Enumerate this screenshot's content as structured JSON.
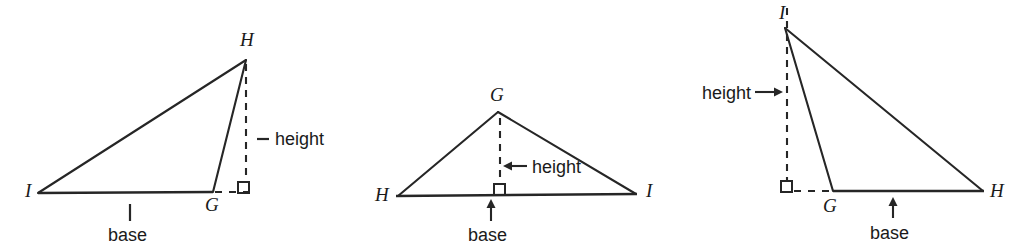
{
  "figure": {
    "kind": "geometry-diagram",
    "stroke_color": "#262626",
    "background_color": "#ffffff",
    "label_color": "#1a1a1a"
  },
  "diagrams": [
    {
      "id": "triangle-1",
      "vertices": [
        {
          "name": "H",
          "label": "H",
          "x": 246,
          "y": 60
        },
        {
          "name": "I",
          "label": "I",
          "x": 38,
          "y": 193
        },
        {
          "name": "G",
          "label": "G",
          "x": 213,
          "y": 192
        }
      ],
      "vertex_label_positions": [
        {
          "name": "H",
          "label": "H",
          "x": 240,
          "y": 46
        },
        {
          "name": "I",
          "label": "I",
          "x": 24,
          "y": 197
        },
        {
          "name": "G",
          "label": "G",
          "x": 206,
          "y": 210
        }
      ],
      "height": {
        "label": "height",
        "label_x": 272,
        "label_y": 145,
        "dashed_from": {
          "x": 246,
          "y": 64
        },
        "dashed_to": {
          "x": 246,
          "y": 188
        },
        "leader_from": {
          "x": 256,
          "y": 139
        },
        "leader_to": {
          "x": 268,
          "y": 139
        },
        "foot": {
          "x": 246,
          "y": 192
        }
      },
      "base": {
        "label": "base",
        "label_x": 110,
        "label_y": 240,
        "tick_x": 130,
        "tick_top": 204,
        "tick_bottom": 222
      },
      "right_angle": {
        "x": 238,
        "y": 182,
        "size": 11
      },
      "base_extension": {
        "from_x": 213,
        "to_x": 248,
        "y": 192
      }
    },
    {
      "id": "triangle-2",
      "vertices": [
        {
          "name": "G",
          "label": "G",
          "x": 498,
          "y": 112
        },
        {
          "name": "H",
          "label": "H",
          "x": 398,
          "y": 196
        },
        {
          "name": "I",
          "label": "I",
          "x": 636,
          "y": 194
        }
      ],
      "vertex_label_positions": [
        {
          "name": "G",
          "label": "G",
          "x": 491,
          "y": 100
        },
        {
          "name": "H",
          "label": "H",
          "x": 376,
          "y": 200
        },
        {
          "name": "I",
          "label": "I",
          "x": 646,
          "y": 196
        }
      ],
      "height": {
        "label": "height",
        "label_x": 529,
        "label_y": 172,
        "dashed_from": {
          "x": 500,
          "y": 116
        },
        "dashed_to": {
          "x": 500,
          "y": 180
        },
        "arrow_from": {
          "x": 525,
          "y": 166
        },
        "arrow_to": {
          "x": 504,
          "y": 166
        },
        "foot": {
          "x": 500,
          "y": 194
        }
      },
      "base": {
        "label": "base",
        "label_x": 469,
        "label_y": 240,
        "arrow_x": 491,
        "arrow_from_y": 221,
        "arrow_to_y": 201
      },
      "right_angle": {
        "x": 494,
        "y": 184,
        "size": 11
      }
    },
    {
      "id": "triangle-3",
      "vertices": [
        {
          "name": "I",
          "label": "I",
          "x": 785,
          "y": 28
        },
        {
          "name": "G",
          "label": "G",
          "x": 833,
          "y": 191
        },
        {
          "name": "H",
          "label": "H",
          "x": 983,
          "y": 191
        }
      ],
      "vertex_label_positions": [
        {
          "name": "I",
          "label": "I",
          "x": 779,
          "y": 18
        },
        {
          "name": "G",
          "label": "G",
          "x": 824,
          "y": 211
        },
        {
          "name": "H",
          "label": "H",
          "x": 990,
          "y": 196
        }
      ],
      "height": {
        "label": "height",
        "label_x": 703,
        "label_y": 98,
        "dashed_from": {
          "x": 787,
          "y": 10
        },
        "dashed_to": {
          "x": 787,
          "y": 186
        },
        "arrow_from": {
          "x": 757,
          "y": 92
        },
        "arrow_to": {
          "x": 783,
          "y": 92
        },
        "foot": {
          "x": 787,
          "y": 191
        }
      },
      "base": {
        "label": "base",
        "label_x": 871,
        "label_y": 238,
        "arrow_x": 893,
        "arrow_from_y": 218,
        "arrow_to_y": 198
      },
      "right_angle": {
        "x": 782,
        "y": 181,
        "size": 11
      },
      "base_extension": {
        "from_x": 795,
        "to_x": 833,
        "y": 191
      }
    }
  ]
}
